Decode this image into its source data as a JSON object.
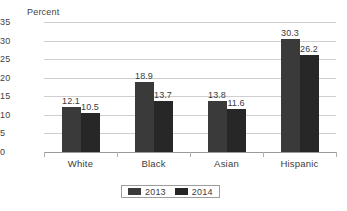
{
  "chart_data": {
    "type": "bar",
    "title": "",
    "subtitle": "",
    "xlabel": "",
    "ylabel": "Percent",
    "ylim": [
      0,
      35
    ],
    "yticks": [
      "0",
      "5",
      "10",
      "15",
      "20",
      "25",
      "30",
      "35"
    ],
    "grid": true,
    "legend_position": "bottom",
    "categories": [
      "White",
      "Black",
      "Asian",
      "Hispanic"
    ],
    "series": [
      {
        "name": "2013",
        "color": "#3a3a3a",
        "values": [
          12.1,
          18.9,
          13.8,
          30.3
        ],
        "labels": [
          "12.1",
          "18.9",
          "13.8",
          "30.3"
        ]
      },
      {
        "name": "2014",
        "color": "#262626",
        "values": [
          10.5,
          13.7,
          11.6,
          26.2
        ],
        "labels": [
          "10.5",
          "13.7",
          "11.6",
          "26.2"
        ]
      }
    ]
  },
  "legend": {
    "items": [
      {
        "label": "2013"
      },
      {
        "label": "2014"
      }
    ]
  }
}
